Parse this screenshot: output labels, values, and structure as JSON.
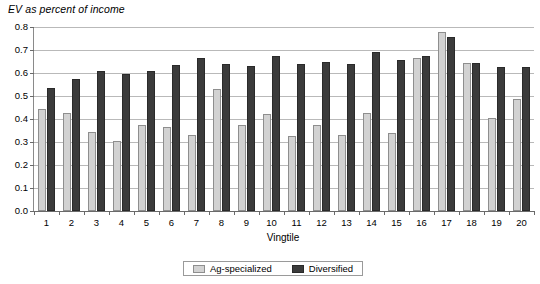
{
  "chart_data": {
    "type": "bar",
    "title": "EV as percent of income",
    "xlabel": "Vingtile",
    "ylabel": "",
    "ylim": [
      0.0,
      0.8
    ],
    "ytick_labels": [
      "0.0",
      "0.1",
      "0.2",
      "0.3",
      "0.4",
      "0.5",
      "0.6",
      "0.7",
      "0.8"
    ],
    "ytick_values": [
      0.0,
      0.1,
      0.2,
      0.3,
      0.4,
      0.5,
      0.6,
      0.7,
      0.8
    ],
    "grid": true,
    "legend_position": "bottom-center",
    "categories": [
      "1",
      "2",
      "3",
      "4",
      "5",
      "6",
      "7",
      "8",
      "9",
      "10",
      "11",
      "12",
      "13",
      "14",
      "15",
      "16",
      "17",
      "18",
      "19",
      "20"
    ],
    "series": [
      {
        "name": "Ag-specialized",
        "color": "#d2d2d2",
        "values": [
          0.445,
          0.425,
          0.345,
          0.305,
          0.375,
          0.365,
          0.33,
          0.53,
          0.375,
          0.42,
          0.325,
          0.375,
          0.33,
          0.425,
          0.34,
          0.665,
          0.78,
          0.645,
          0.405,
          0.485
        ]
      },
      {
        "name": "Diversified",
        "color": "#3b3b3b",
        "values": [
          0.535,
          0.575,
          0.61,
          0.595,
          0.61,
          0.635,
          0.665,
          0.64,
          0.63,
          0.675,
          0.64,
          0.65,
          0.64,
          0.69,
          0.655,
          0.675,
          0.755,
          0.645,
          0.625,
          0.625
        ]
      }
    ]
  },
  "legend": {
    "items": [
      {
        "label": "Ag-specialized",
        "swatch": "light-gray-swatch"
      },
      {
        "label": "Diversified",
        "swatch": "dark-gray-swatch"
      }
    ]
  }
}
